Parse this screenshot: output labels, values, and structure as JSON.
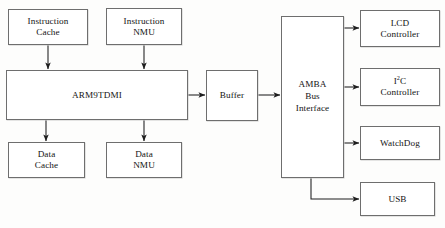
{
  "diagram": {
    "background_color": "#fdfdfc",
    "line_color": "#1e1e1e",
    "box_border_color": "#6e6e6e",
    "box_fill_color": "#ffffff",
    "nodes": [
      {
        "id": "instruction-cache",
        "label": "Instruction\nCache",
        "x": 8,
        "y": 9,
        "w": 80,
        "h": 36
      },
      {
        "id": "instruction-nmu",
        "label": "Instruction\nNMU",
        "x": 106,
        "y": 8,
        "w": 76,
        "h": 37
      },
      {
        "id": "arm9tdmi",
        "label": "ARM9TDMI",
        "x": 6,
        "y": 70,
        "w": 182,
        "h": 50
      },
      {
        "id": "data-cache",
        "label": "Data\nCache",
        "x": 8,
        "y": 142,
        "w": 77,
        "h": 36
      },
      {
        "id": "data-nmu",
        "label": "Data\nNMU",
        "x": 106,
        "y": 142,
        "w": 76,
        "h": 36
      },
      {
        "id": "buffer",
        "label": "Buffer",
        "x": 206,
        "y": 70,
        "w": 52,
        "h": 51
      },
      {
        "id": "amba-bus-interface",
        "label": "AMBA\nBus\nInterface",
        "x": 281,
        "y": 16,
        "w": 63,
        "h": 162
      },
      {
        "id": "lcd-controller",
        "label": "LCD\nController",
        "x": 360,
        "y": 10,
        "w": 80,
        "h": 37
      },
      {
        "id": "i2c-controller",
        "label": "I2C\nController",
        "x": 360,
        "y": 68,
        "w": 80,
        "h": 38
      },
      {
        "id": "watchdog",
        "label": "WatchDog",
        "x": 360,
        "y": 126,
        "w": 80,
        "h": 34
      },
      {
        "id": "usb",
        "label": "USB",
        "x": 360,
        "y": 182,
        "w": 75,
        "h": 34
      }
    ],
    "connections": [
      {
        "id": "instruction-cache-to-arm9tdmi",
        "from": "instruction-cache",
        "to": "arm9tdmi",
        "orientation": "vertical",
        "arrowheads": "both"
      },
      {
        "id": "instruction-nmu-to-arm9tdmi",
        "from": "instruction-nmu",
        "to": "arm9tdmi",
        "orientation": "vertical",
        "arrowheads": "both"
      },
      {
        "id": "arm9tdmi-to-data-cache",
        "from": "arm9tdmi",
        "to": "data-cache",
        "orientation": "vertical",
        "arrowheads": "both"
      },
      {
        "id": "arm9tdmi-to-data-nmu",
        "from": "arm9tdmi",
        "to": "data-nmu",
        "orientation": "vertical",
        "arrowheads": "both"
      },
      {
        "id": "arm9tdmi-to-buffer",
        "from": "arm9tdmi",
        "to": "buffer",
        "orientation": "horizontal",
        "arrowheads": "both"
      },
      {
        "id": "buffer-to-amba",
        "from": "buffer",
        "to": "amba-bus-interface",
        "orientation": "horizontal",
        "arrowheads": "both"
      },
      {
        "id": "amba-to-lcd-controller",
        "from": "amba-bus-interface",
        "to": "lcd-controller",
        "orientation": "horizontal",
        "arrowheads": "both"
      },
      {
        "id": "amba-to-i2c-controller",
        "from": "amba-bus-interface",
        "to": "i2c-controller",
        "orientation": "horizontal",
        "arrowheads": "both"
      },
      {
        "id": "amba-to-watchdog",
        "from": "amba-bus-interface",
        "to": "watchdog",
        "orientation": "horizontal",
        "arrowheads": "both"
      },
      {
        "id": "amba-to-usb",
        "from": "amba-bus-interface",
        "to": "usb",
        "orientation": "elbow",
        "arrowheads": "both"
      }
    ]
  }
}
